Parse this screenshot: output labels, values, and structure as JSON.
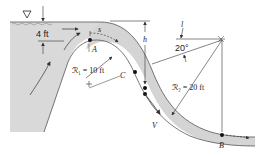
{
  "diagram": {
    "labels": {
      "depth": "4 ft",
      "s_coord": "s",
      "point_a": "A",
      "point_b": "B",
      "point_c": "C",
      "radius_1": "ℛ₁ = 10 ft",
      "radius_2": "ℛ₂ = 20 ft",
      "height": "h",
      "length": "l",
      "angle": "20°",
      "velocity": "V"
    },
    "colors": {
      "water": "#d9d9d9",
      "water_dark": "#c4c4c4",
      "lines": "#333333",
      "background": "#ffffff"
    },
    "icons": {
      "free_surface": "inverted-triangle-icon"
    }
  }
}
